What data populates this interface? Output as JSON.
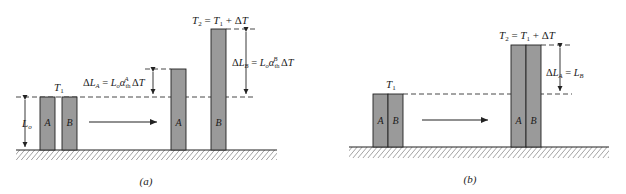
{
  "figure": {
    "panel_a": {
      "caption": "(a)",
      "initial": {
        "temperature_label": "T₁",
        "bar_labels": [
          "A",
          "B"
        ],
        "length_label": "Lₒ"
      },
      "final": {
        "temperature_label": "T₂ = T₁ + ΔT",
        "bar_labels": [
          "A",
          "B"
        ],
        "delta_a_label": "ΔL_A = Lₒα_th^A ΔT",
        "delta_b_label": "ΔL_B = Lₒα_th^B ΔT"
      }
    },
    "panel_b": {
      "caption": "(b)",
      "initial": {
        "temperature_label": "T₁",
        "bar_labels": [
          "A",
          "B"
        ]
      },
      "final": {
        "temperature_label": "T₂ = T₁ + ΔT",
        "bar_labels": [
          "A",
          "B"
        ],
        "delta_label": "ΔL_A = L_B"
      }
    },
    "colors": {
      "bar_fill": "#9a9a9a",
      "stroke": "#222222"
    }
  }
}
